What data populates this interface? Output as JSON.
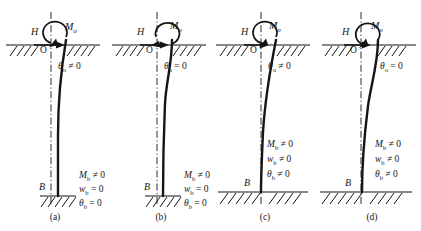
{
  "figure": {
    "width": 421,
    "height": 231,
    "background": "#ffffff",
    "ink": "#151515"
  },
  "symbols": {
    "lateral_load": "H",
    "origin": "O",
    "base_point": "B",
    "moment_head": "M",
    "moment_head_sub": "o",
    "not_equal_zero": "≠ 0",
    "equal_zero": "= 0"
  },
  "panels": [
    {
      "id": "a",
      "caption": "(a)",
      "load_label": "H",
      "origin_label": "O",
      "base_label": "B",
      "moment_label": "M",
      "moment_sub": "o",
      "moment_direction": "clockwise",
      "head_condition": {
        "symbol": "θ",
        "sub": "o",
        "relation": "≠ 0"
      },
      "tip_conditions": [
        {
          "symbol": "M",
          "sub": "b",
          "relation": "≠ 0"
        },
        {
          "symbol": "w",
          "sub": "b",
          "relation": "= 0"
        },
        {
          "symbol": "θ",
          "sub": "b",
          "relation": "= 0"
        }
      ],
      "base_support": "fixed-short",
      "deflection_shape": "single-curvature"
    },
    {
      "id": "b",
      "caption": "(b)",
      "load_label": "H",
      "origin_label": "O",
      "base_label": "B",
      "moment_label": "M",
      "moment_sub": "o",
      "moment_direction": "counterclockwise",
      "head_condition": {
        "symbol": "θ",
        "sub": "o",
        "relation": "= 0"
      },
      "tip_conditions": [
        {
          "symbol": "M",
          "sub": "b",
          "relation": "≠ 0"
        },
        {
          "symbol": "w",
          "sub": "b",
          "relation": "= 0"
        },
        {
          "symbol": "θ",
          "sub": "b",
          "relation": "= 0"
        }
      ],
      "base_support": "fixed-short",
      "deflection_shape": "double-curvature"
    },
    {
      "id": "c",
      "caption": "(c)",
      "load_label": "H",
      "origin_label": "O",
      "base_label": "B",
      "moment_label": "M",
      "moment_sub": "o",
      "moment_direction": "clockwise",
      "head_condition": {
        "symbol": "θ",
        "sub": "o",
        "relation": "≠ 0"
      },
      "tip_conditions": [
        {
          "symbol": "M",
          "sub": "b",
          "relation": "≠ 0"
        },
        {
          "symbol": "w",
          "sub": "b",
          "relation": "≠ 0"
        },
        {
          "symbol": "θ",
          "sub": "b",
          "relation": "≠ 0"
        }
      ],
      "base_support": "bedrock-wide",
      "deflection_shape": "single-curvature"
    },
    {
      "id": "d",
      "caption": "(d)",
      "load_label": "H",
      "origin_label": "O",
      "base_label": "B",
      "moment_label": "M",
      "moment_sub": "o",
      "moment_direction": "clockwise",
      "head_condition": {
        "symbol": "θ",
        "sub": "o",
        "relation": "= 0"
      },
      "tip_conditions": [
        {
          "symbol": "M",
          "sub": "b",
          "relation": "≠ 0"
        },
        {
          "symbol": "w",
          "sub": "b",
          "relation": "≠ 0"
        },
        {
          "symbol": "θ",
          "sub": "b",
          "relation": "≠ 0"
        }
      ],
      "base_support": "bedrock-wide",
      "deflection_shape": "double-curvature"
    }
  ]
}
